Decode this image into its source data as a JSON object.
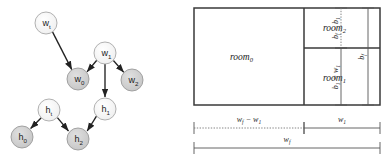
{
  "figure": {
    "panels": [
      "dependency-graph",
      "floorplan-diagram"
    ],
    "background_color": "#ffffff"
  },
  "graph": {
    "title": "",
    "node_fill_light": "#f2f2f2",
    "node_fill_dark": "#cdcdcd",
    "node_stroke": "#9a9a9a",
    "edge_color": "#222222",
    "nodes": [
      {
        "id": "w_t",
        "base": "w",
        "sub": "t",
        "cx": 46,
        "cy": 23,
        "r": 11,
        "shade": "light"
      },
      {
        "id": "w_1",
        "base": "w",
        "sub": "1",
        "cx": 105,
        "cy": 53,
        "r": 11,
        "shade": "light"
      },
      {
        "id": "w_0",
        "base": "w",
        "sub": "0",
        "cx": 78,
        "cy": 79,
        "r": 11,
        "shade": "dark"
      },
      {
        "id": "w_2",
        "base": "w",
        "sub": "2",
        "cx": 132,
        "cy": 80,
        "r": 11,
        "shade": "dark"
      },
      {
        "id": "h_t",
        "base": "h",
        "sub": "t",
        "cx": 49,
        "cy": 110,
        "r": 11,
        "shade": "light"
      },
      {
        "id": "h_1",
        "base": "h",
        "sub": "1",
        "cx": 105,
        "cy": 109,
        "r": 11,
        "shade": "light"
      },
      {
        "id": "h_0",
        "base": "h",
        "sub": "0",
        "cx": 22,
        "cy": 137,
        "r": 11,
        "shade": "dark"
      },
      {
        "id": "h_2",
        "base": "h",
        "sub": "2",
        "cx": 78,
        "cy": 139,
        "r": 11,
        "shade": "dark"
      }
    ],
    "edges": [
      {
        "from": "w_t",
        "to": "w_0"
      },
      {
        "from": "w_1",
        "to": "w_0"
      },
      {
        "from": "w_1",
        "to": "w_2"
      },
      {
        "from": "w_1",
        "to": "h_1"
      },
      {
        "from": "h_t",
        "to": "h_0"
      },
      {
        "from": "h_t",
        "to": "h_2"
      },
      {
        "from": "h_1",
        "to": "h_2"
      }
    ]
  },
  "floorplan": {
    "outline_stroke": "#3a3a3a",
    "divider_stroke": "#3a3a3a",
    "dimension_stroke": "#555555",
    "rooms": [
      {
        "id": "room_0",
        "base": "room",
        "sub": "0",
        "x": 8,
        "y": 8,
        "w": 110,
        "h": 97
      },
      {
        "id": "room_2",
        "base": "room",
        "sub": "2",
        "x": 118,
        "y": 8,
        "w": 76,
        "h": 40
      },
      {
        "id": "room_1",
        "base": "room",
        "sub": "1",
        "x": 118,
        "y": 48,
        "w": 76,
        "h": 57
      }
    ],
    "vertical_dimensions": [
      {
        "id": "bf-minus-b1",
        "parts": [
          "b",
          "f",
          " − ",
          "b",
          "1"
        ],
        "text": "b_f − b_1",
        "style": "dotted"
      },
      {
        "id": "b1-equals-w1",
        "parts": [
          "b",
          "1",
          " = ",
          "w",
          "1"
        ],
        "text": "b_1 = w_1",
        "style": "solid"
      },
      {
        "id": "bf",
        "parts": [
          "b",
          "f"
        ],
        "text": "b_f",
        "style": "solid"
      }
    ],
    "horizontal_dimensions": [
      {
        "id": "wf-minus-w1",
        "text": "w_f − w_1",
        "style": "dotted"
      },
      {
        "id": "w1",
        "text": "w_1",
        "style": "solid"
      },
      {
        "id": "wf",
        "text": "w_f",
        "style": "solid"
      }
    ]
  }
}
